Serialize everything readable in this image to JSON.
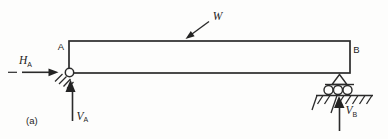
{
  "figure": {
    "caption_label": "(a)",
    "colors": {
      "ink": "#2b2b2b",
      "background": "#fdfdfc"
    },
    "beam": {
      "left_end_label": "A",
      "right_end_label": "B"
    },
    "load": {
      "symbol": "W"
    },
    "reactions": {
      "horizontal_left": {
        "base": "H",
        "sub": "A"
      },
      "vertical_left": {
        "base": "V",
        "sub": "A"
      },
      "vertical_right": {
        "base": "V",
        "sub": "B"
      }
    },
    "supports": {
      "left_icon": "pinned-support-icon",
      "right_icon": "roller-support-icon"
    }
  }
}
